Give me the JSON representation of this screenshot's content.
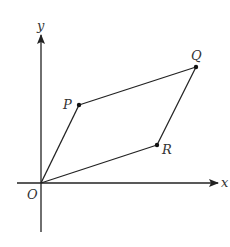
{
  "diagram": {
    "type": "coordinate-parallelogram",
    "colors": {
      "stroke": "#222222",
      "label": "#333333",
      "background": "#ffffff"
    },
    "axes": {
      "x_label": "x",
      "y_label": "y",
      "origin_label": "O"
    },
    "points": [
      {
        "id": "O",
        "label": "O"
      },
      {
        "id": "P",
        "label": "P"
      },
      {
        "id": "Q",
        "label": "Q"
      },
      {
        "id": "R",
        "label": "R"
      }
    ],
    "segments": [
      {
        "from": "O",
        "to": "P"
      },
      {
        "from": "P",
        "to": "Q"
      },
      {
        "from": "Q",
        "to": "R"
      },
      {
        "from": "R",
        "to": "O"
      }
    ]
  }
}
